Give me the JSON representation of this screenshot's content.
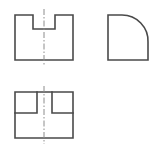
{
  "drawing": {
    "title": "Third-angle orthographic projection of a notched block",
    "sheet": {
      "width": 161,
      "height": 151,
      "background": "#ffffff"
    },
    "style": {
      "object_line_color": "#4a4a4a",
      "object_line_width": 1.6,
      "center_line_color": "#8c8c8c",
      "center_line_width": 1,
      "center_line_dash": "6,2,1.5,2"
    },
    "views": [
      {
        "name": "front-view",
        "label": "Front view",
        "description": "Rectangular block with a rectangular notch cut into the top edge, symmetric about the vertical centerline",
        "bounds": {
          "x": 15,
          "y": 15,
          "width": 58,
          "height": 45
        },
        "outline_points": "15,15 33,15 33,29 55,29 55,15 73,15 73,60 15,60 15,15",
        "features": [
          {
            "name": "top-notch",
            "left": 33,
            "right": 55,
            "depth_y": 29,
            "width": 22,
            "depth": 14
          }
        ],
        "centerlines": [
          {
            "name": "vertical-centerline",
            "x1": 44,
            "y1": 9,
            "x2": 44,
            "y2": 66
          }
        ]
      },
      {
        "name": "right-side-view",
        "label": "Right side view",
        "description": "L-shaped profile whose upper-right corner is removed by a concave quarter-round fillet",
        "bounds": {
          "x": 108,
          "y": 15,
          "width": 40,
          "height": 45
        },
        "outline_points": "108,15 122,15 148,42 148,60 108,60 108,15",
        "features": [
          {
            "name": "concave-fillet-arc",
            "start_x": 122,
            "start_y": 15,
            "end_x": 148,
            "end_y": 42,
            "radius": 26,
            "sweep": "concave"
          }
        ],
        "centerlines": []
      },
      {
        "name": "top-view",
        "label": "Top view",
        "description": "Rectangle with two inner rectangles at the upper corners representing the notch edges, symmetric about the vertical centerline",
        "bounds": {
          "x": 15,
          "y": 92,
          "width": 58,
          "height": 46
        },
        "outline_points": "15,92 73,92 73,138 15,138 15,92",
        "features": [
          {
            "name": "left-inner-rectangle",
            "x": 15,
            "y": 92,
            "width": 22,
            "height": 21,
            "edges": "vertical at x=37 from y=92 to y=113; horizontal at y=113 from x=15 to x=37"
          },
          {
            "name": "right-inner-rectangle",
            "x": 52,
            "y": 92,
            "width": 21,
            "height": 21,
            "edges": "vertical at x=52 from y=92 to y=113; horizontal at y=113 from x=52 to x=73"
          }
        ],
        "centerlines": [
          {
            "name": "vertical-centerline",
            "x1": 44,
            "y1": 86,
            "x2": 44,
            "y2": 144
          }
        ]
      }
    ]
  }
}
